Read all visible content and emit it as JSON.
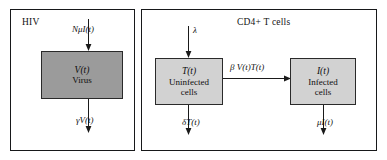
{
  "figure": {
    "panels": [
      {
        "id": "hiv",
        "title": "HIV",
        "boxes": [
          {
            "id": "virus",
            "symbol": "V(t)",
            "label": "Virus",
            "fill": "#9b9b9b"
          }
        ],
        "flows": [
          {
            "id": "production",
            "label": "NμI(t)",
            "direction": "down-in"
          },
          {
            "id": "clearance",
            "label": "γV(t)",
            "direction": "down-out"
          }
        ]
      },
      {
        "id": "cd4",
        "title": "CD4+ T cells",
        "boxes": [
          {
            "id": "uninfected",
            "symbol": "T(t)",
            "label_line1": "Uninfected",
            "label_line2": "cells",
            "fill": "#d2d2d2"
          },
          {
            "id": "infected",
            "symbol": "I(t)",
            "label_line1": "Infected",
            "label_line2": "cells",
            "fill": "#d2d2d2"
          }
        ],
        "flows": [
          {
            "id": "source",
            "label": "λ",
            "direction": "down-in"
          },
          {
            "id": "infection",
            "label": "β V(t)T(t)",
            "direction": "right"
          },
          {
            "id": "death-uninfected",
            "label": "δT(t)",
            "direction": "down-out"
          },
          {
            "id": "death-infected",
            "label": "μI(t)",
            "direction": "down-out"
          }
        ]
      }
    ],
    "colors": {
      "panel_border": "#17181a",
      "box_border": "#2a2a2a",
      "virus_fill": "#9b9b9b",
      "tcell_fill": "#d2d2d2",
      "arrow": "#1a1a1a",
      "background": "#ffffff"
    }
  }
}
